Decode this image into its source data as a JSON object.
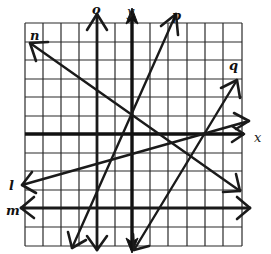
{
  "diagram": {
    "type": "coordinate-grid-lines",
    "grid": {
      "columns": 12,
      "rows": 12
    },
    "axes": {
      "x_label": "x",
      "y_label": "y"
    },
    "lines": [
      {
        "id": "o",
        "label": "o",
        "description": "vertical line left of y-axis"
      },
      {
        "id": "p",
        "label": "p",
        "description": "steep positive slope through origin"
      },
      {
        "id": "q",
        "label": "q",
        "description": "steep positive slope, crosses x-axis right of origin"
      },
      {
        "id": "n",
        "label": "n",
        "description": "negative slope from upper left to lower right"
      },
      {
        "id": "l",
        "label": "l",
        "description": "shallow positive slope"
      },
      {
        "id": "m",
        "label": "m",
        "description": "horizontal line below x-axis"
      }
    ]
  }
}
